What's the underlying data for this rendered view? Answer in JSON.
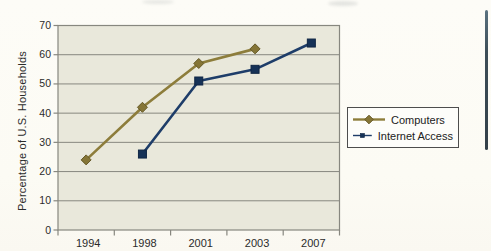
{
  "page": {
    "background_color": "#fcfbf5",
    "edge_rule_color": "#3d4e58"
  },
  "chart_data": {
    "type": "line",
    "title": "",
    "categories": [
      "1994",
      "1998",
      "2001",
      "2003",
      "2007"
    ],
    "series": [
      {
        "name": "Computers",
        "marker": "diamond",
        "color": "#8d7d3b",
        "marker_fill": "#857536",
        "marker_stroke": "#665a28",
        "values": [
          24,
          42,
          57,
          62,
          null
        ]
      },
      {
        "name": "Internet Access",
        "marker": "square",
        "color": "#1e3d69",
        "marker_fill": "#163257",
        "marker_stroke": "#112745",
        "values": [
          null,
          26,
          51,
          55,
          64
        ]
      }
    ],
    "xlabel": "",
    "ylabel": "Percentage of U.S. Households",
    "ylim": [
      0,
      70
    ],
    "yticks": [
      0,
      10,
      20,
      30,
      40,
      50,
      60,
      70
    ],
    "grid": true,
    "legend_position": "right-middle",
    "plot_bg": "#e9e8db",
    "grid_color": "#87877f",
    "tick_text_color": "#2b2b2b"
  }
}
